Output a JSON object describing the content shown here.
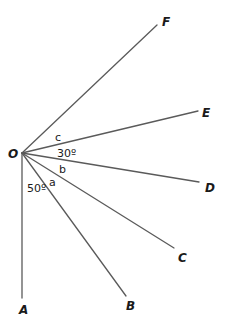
{
  "diagram": {
    "vertex": {
      "label": "O",
      "x": 22,
      "y": 153
    },
    "rays": [
      {
        "name": "ray-OF",
        "label": "F",
        "end": [
          157,
          25
        ],
        "label_pos": [
          162,
          26
        ]
      },
      {
        "name": "ray-OE",
        "label": "E",
        "end": [
          198,
          111
        ],
        "label_pos": [
          202,
          117
        ]
      },
      {
        "name": "ray-OD",
        "label": "D",
        "end": [
          199,
          182
        ],
        "label_pos": [
          205,
          192
        ]
      },
      {
        "name": "ray-OC",
        "label": "C",
        "end": [
          174,
          248
        ],
        "label_pos": [
          178,
          262
        ]
      },
      {
        "name": "ray-OB",
        "label": "B",
        "end": [
          126,
          296
        ],
        "label_pos": [
          126,
          310
        ]
      },
      {
        "name": "ray-OA",
        "label": "A",
        "end": [
          22,
          298
        ],
        "label_pos": [
          19,
          314
        ]
      }
    ],
    "angle_labels": [
      {
        "name": "angle-c",
        "text": "c",
        "pos": [
          55,
          141
        ]
      },
      {
        "name": "angle-30",
        "text": "30º",
        "pos": [
          57,
          157
        ]
      },
      {
        "name": "angle-b",
        "text": "b",
        "pos": [
          59,
          173
        ]
      },
      {
        "name": "angle-a",
        "text": "a",
        "pos": [
          49,
          186
        ]
      },
      {
        "name": "angle-50",
        "text": "50º",
        "pos": [
          27,
          192
        ]
      }
    ]
  }
}
